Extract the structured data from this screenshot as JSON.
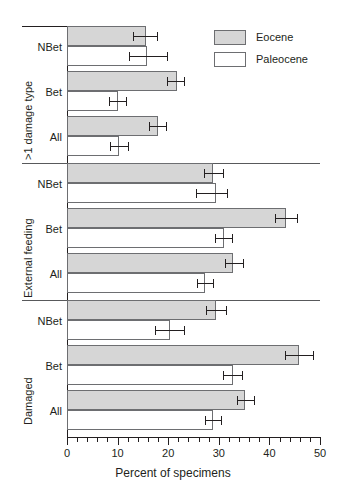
{
  "chart_data": {
    "type": "bar",
    "orientation": "horizontal",
    "title": "",
    "xlabel": "Percent of specimens",
    "ylabel": "",
    "xlim": [
      0,
      50
    ],
    "xticks": [
      0,
      10,
      20,
      30,
      40,
      50
    ],
    "xticklabels": [
      "0",
      "10",
      "20",
      "30",
      "40",
      "50"
    ],
    "minor_tick_interval": 2,
    "grid": false,
    "legend": {
      "position": "top-right",
      "entries": [
        {
          "name": "Eocene",
          "color": "#d6d6d6"
        },
        {
          "name": "Paleocene",
          "color": "#ffffff"
        }
      ]
    },
    "groups": [
      {
        "label": ">1 damage type",
        "categories": [
          "NBet",
          "Bet",
          "All"
        ],
        "series": [
          {
            "name": "Eocene",
            "values": [
              15.7,
              21.8,
              18.0
            ],
            "err_low": [
              13.0,
              19.8,
              16.3
            ],
            "err_high": [
              17.8,
              23.2,
              19.6
            ]
          },
          {
            "name": "Paleocene",
            "values": [
              15.9,
              10.0,
              10.2
            ],
            "err_low": [
              12.2,
              8.3,
              8.5
            ],
            "err_high": [
              19.8,
              11.7,
              12.0
            ]
          }
        ]
      },
      {
        "label": "External feeding",
        "categories": [
          "NBet",
          "Bet",
          "All"
        ],
        "series": [
          {
            "name": "Eocene",
            "values": [
              28.9,
              43.3,
              32.9
            ],
            "err_low": [
              27.0,
              41.1,
              31.3
            ],
            "err_high": [
              30.8,
              45.5,
              34.7
            ]
          },
          {
            "name": "Paleocene",
            "values": [
              29.4,
              31.0,
              27.2
            ],
            "err_low": [
              25.4,
              29.3,
              25.7
            ],
            "err_high": [
              31.6,
              32.6,
              28.8
            ]
          }
        ]
      },
      {
        "label": "Damaged",
        "categories": [
          "NBet",
          "Bet",
          "All"
        ],
        "series": [
          {
            "name": "Eocene",
            "values": [
              29.5,
              45.8,
              35.2
            ],
            "err_low": [
              27.5,
              43.0,
              33.6
            ],
            "err_high": [
              31.4,
              48.6,
              37.0
            ]
          },
          {
            "name": "Paleocene",
            "values": [
              20.4,
              32.8,
              28.9
            ],
            "err_low": [
              17.4,
              30.9,
              27.2
            ],
            "err_high": [
              23.1,
              34.6,
              30.5
            ]
          }
        ]
      }
    ]
  },
  "axis": {
    "xlabel": "Percent of specimens",
    "ticklabels": [
      "0",
      "10",
      "20",
      "30",
      "40",
      "50"
    ]
  },
  "legend": {
    "eocene": "Eocene",
    "paleocene": "Paleocene"
  },
  "groups": {
    "g0": {
      "label": ">1 damage type",
      "c0": "NBet",
      "c1": "Bet",
      "c2": "All"
    },
    "g1": {
      "label": "External feeding",
      "c0": "NBet",
      "c1": "Bet",
      "c2": "All"
    },
    "g2": {
      "label": "Damaged",
      "c0": "NBet",
      "c1": "Bet",
      "c2": "All"
    }
  }
}
